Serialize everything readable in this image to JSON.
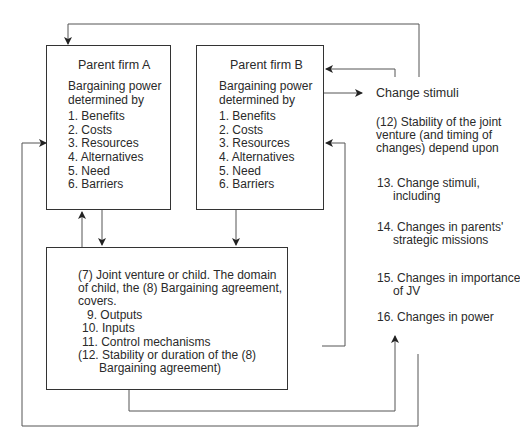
{
  "parent_a": {
    "title": "Parent firm A",
    "subtitle_1": "Bargaining power",
    "subtitle_2": "determined by",
    "items": [
      "1. Benefits",
      "2. Costs",
      "3. Resources",
      "4. Alternatives",
      "5. Need",
      "6. Barriers"
    ]
  },
  "parent_b": {
    "title": "Parent firm B",
    "subtitle_1": "Bargaining power",
    "subtitle_2": "determined by",
    "items": [
      "1. Benefits",
      "2. Costs",
      "3. Resources",
      "4. Alternatives",
      "5. Need",
      "6. Barriers"
    ]
  },
  "joint_venture": {
    "line_1": "(7) Joint venture or child. The domain",
    "line_2": "of child, the (8) Bargaining agreement,",
    "line_3": "covers.",
    "items": [
      "9. Outputs",
      "10. Inputs",
      "11. Control mechanisms",
      "(12. Stability or duration of the (8)"
    ],
    "item_12_cont": "Bargaining agreement)"
  },
  "right_panel": {
    "change_stimuli": "Change stimuli",
    "stability_1": "(12) Stability of the joint",
    "stability_2": "venture (and timing of",
    "stability_3": "changes) depend upon",
    "item13_1": "13. Change stimuli,",
    "item13_2": "including",
    "item14_1": "14. Changes in parents'",
    "item14_2": "strategic missions",
    "item15_1": "15. Changes in importance",
    "item15_2": "of JV",
    "item16": "16. Changes in power"
  }
}
